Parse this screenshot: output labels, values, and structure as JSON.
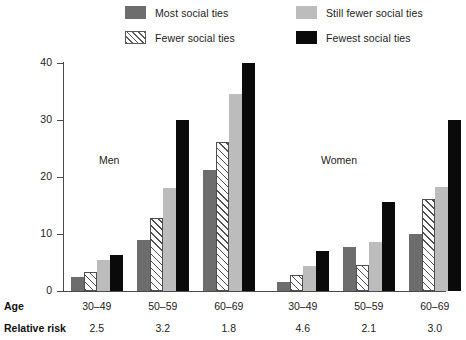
{
  "legend": {
    "items": [
      {
        "label": "Most social ties",
        "key": "most",
        "color": "#6d6d6d"
      },
      {
        "label": "Still fewer social ties",
        "key": "still",
        "color": "#bcbcbc"
      },
      {
        "label": "Fewer social ties",
        "key": "fewer",
        "color": "#ffffff"
      },
      {
        "label": "Fewest social ties",
        "key": "fewest",
        "color": "#0a0a0a"
      }
    ]
  },
  "axis": {
    "y_title": "Percentage dying from all causes",
    "y_ticks": [
      "0",
      "10",
      "20",
      "30",
      "40"
    ]
  },
  "panels": [
    {
      "label": "Men"
    },
    {
      "label": "Women"
    }
  ],
  "rows": {
    "age_label": "Age",
    "risk_label": "Relative risk"
  },
  "chart_data": {
    "type": "bar",
    "title": "",
    "xlabel": "Age",
    "ylabel": "Percentage dying from all causes",
    "ylim": [
      0,
      40
    ],
    "yticks": [
      0,
      10,
      20,
      30,
      40
    ],
    "grid": false,
    "legend_position": "top",
    "groups": [
      "Men",
      "Women"
    ],
    "categories": [
      "30-49",
      "50-59",
      "60-69",
      "30-49",
      "50-59",
      "60-69"
    ],
    "category_labels": [
      "30–49",
      "50–59",
      "60–69",
      "30–49",
      "50–59",
      "60–69"
    ],
    "relative_risk": [
      "2.5",
      "3.2",
      "1.8",
      "4.6",
      "2.1",
      "3.0"
    ],
    "series": [
      {
        "name": "Most social ties",
        "color": "#6d6d6d",
        "values": [
          2.4,
          9.0,
          21.2,
          1.5,
          7.8,
          10.0
        ]
      },
      {
        "name": "Fewer social ties",
        "color": "#ffffff",
        "hatch": true,
        "values": [
          3.4,
          12.8,
          26.2,
          2.8,
          4.5,
          16.2
        ]
      },
      {
        "name": "Still fewer social ties",
        "color": "#bcbcbc",
        "values": [
          5.4,
          18.0,
          34.5,
          4.4,
          8.6,
          18.3
        ]
      },
      {
        "name": "Fewest social ties",
        "color": "#0a0a0a",
        "values": [
          6.4,
          30.0,
          40.0,
          7.0,
          15.7,
          30.0
        ]
      }
    ]
  }
}
